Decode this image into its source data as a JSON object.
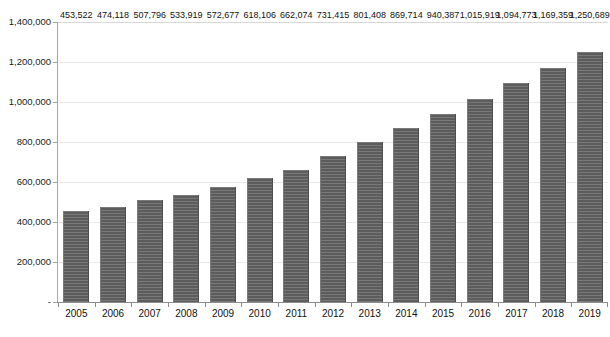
{
  "chart_data": {
    "type": "bar",
    "title": "",
    "subtitle": "",
    "xlabel": "",
    "ylabel": "",
    "categories": [
      "2005",
      "2006",
      "2007",
      "2008",
      "2009",
      "2010",
      "2011",
      "2012",
      "2013",
      "2014",
      "2015",
      "2016",
      "2017",
      "2018",
      "2019"
    ],
    "values": [
      453522,
      474118,
      507796,
      533919,
      572677,
      618106,
      662074,
      731415,
      801408,
      869714,
      940387,
      1015919,
      1094773,
      1169359,
      1250689
    ],
    "value_labels": [
      "453,522",
      "474,118",
      "507,796",
      "533,919",
      "572,677",
      "618,106",
      "662,074",
      "731,415",
      "801,408",
      "869,714",
      "940,387",
      "1,015,919",
      "1,094,773",
      "1,169,359",
      "1,250,689"
    ],
    "ylim": [
      0,
      1400000
    ],
    "y_ticks": [
      0,
      200000,
      400000,
      600000,
      800000,
      1000000,
      1200000,
      1400000
    ],
    "y_tick_labels": [
      "-",
      "200,000",
      "400,000",
      "600,000",
      "800,000",
      "1,000,000",
      "1,200,000",
      "1,400,000"
    ],
    "grid": true,
    "grid_axis": "y",
    "legend": null,
    "legend_position": "none",
    "annotations": "data labels shown above every bar",
    "series": [
      {
        "name": "",
        "values": [
          453522,
          474118,
          507796,
          533919,
          572677,
          618106,
          662074,
          731415,
          801408,
          869714,
          940387,
          1015919,
          1094773,
          1169359,
          1250689
        ]
      }
    ]
  },
  "colors": {
    "bar_fill": "#656565",
    "bar_edge_light": "#7a7a7a",
    "bar_edge_dark": "#4f4f4f",
    "gridline": "#e8e8e8",
    "axis_line": "#8c8c8c",
    "text": "#111111",
    "background": "#ffffff",
    "caption": "#b9b9b9"
  },
  "caption": {
    "text": "",
    "visible": false
  }
}
